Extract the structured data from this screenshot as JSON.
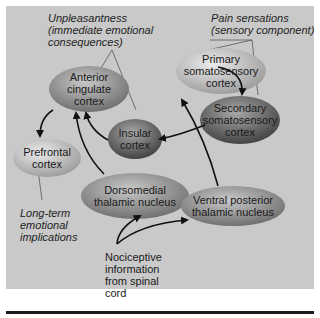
{
  "annotations": {
    "unpleasantness": [
      "Unpleasantness",
      "(immediate emotional",
      "consequences)"
    ],
    "pain_sensations": [
      "Pain sensations",
      "(sensory component)"
    ],
    "long_term": [
      "Long-term",
      "emotional",
      "implications"
    ],
    "nociceptive": [
      "Nociceptive",
      "information",
      "from spinal",
      "cord"
    ]
  },
  "nodes": {
    "acc": [
      "Anterior",
      "cingulate",
      "cortex"
    ],
    "primary": [
      "Primary",
      "somatosensory",
      "cortex"
    ],
    "secondary": [
      "Secondary",
      "somatosensory",
      "cortex"
    ],
    "insular": [
      "Insular",
      "cortex"
    ],
    "prefrontal": [
      "Prefrontal",
      "cortex"
    ],
    "dorsomedial": [
      "Dorsomedial",
      "thalamic nucleus"
    ],
    "vpl": [
      "Ventral posterior",
      "thalamic nucleus"
    ]
  },
  "colors": {
    "panel": "#c9c9c9",
    "arrow": "#111111",
    "leader": "#555555"
  }
}
